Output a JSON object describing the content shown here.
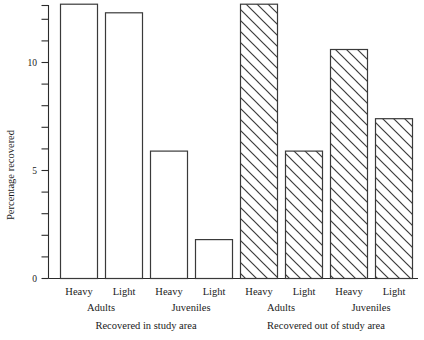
{
  "chart_data": {
    "type": "bar",
    "title": "",
    "subtitle": "",
    "xlabel": "",
    "ylabel": "Percentage recovered",
    "ylim": [
      0,
      13.3
    ],
    "yticks_major": [
      0,
      5,
      10
    ],
    "ytick_labels": [
      "0",
      "5",
      "10"
    ],
    "yticks_minor": [
      1,
      2,
      3,
      4,
      6,
      7,
      8,
      9,
      11,
      12,
      13
    ],
    "grid": false,
    "legend_position": "none",
    "categories": [
      "Heavy",
      "Light",
      "Heavy",
      "Light",
      "Heavy",
      "Light",
      "Heavy",
      "Light"
    ],
    "values": [
      12.7,
      12.3,
      5.9,
      1.8,
      12.7,
      5.9,
      10.6,
      7.4
    ],
    "bar_styles": [
      "open",
      "open",
      "open",
      "open",
      "hatched",
      "hatched",
      "hatched",
      "hatched"
    ],
    "groups": [
      {
        "label": "Adults",
        "bars": [
          0,
          1
        ]
      },
      {
        "label": "Juveniles",
        "bars": [
          2,
          3
        ]
      },
      {
        "label": "Adults",
        "bars": [
          4,
          5
        ]
      },
      {
        "label": "Juveniles",
        "bars": [
          6,
          7
        ]
      }
    ],
    "panels": [
      {
        "caption": "Recovered in study area",
        "bars": [
          0,
          1,
          2,
          3
        ]
      },
      {
        "caption": "Recovered out of study area",
        "bars": [
          4,
          5,
          6,
          7
        ]
      }
    ],
    "series": [
      {
        "name": "Recovered in study area",
        "style": "open",
        "points": [
          {
            "age": "Adults",
            "infestation": "Heavy",
            "value": 12.7
          },
          {
            "age": "Adults",
            "infestation": "Light",
            "value": 12.3
          },
          {
            "age": "Juveniles",
            "infestation": "Heavy",
            "value": 5.9
          },
          {
            "age": "Juveniles",
            "infestation": "Light",
            "value": 1.8
          }
        ]
      },
      {
        "name": "Recovered out of study area",
        "style": "hatched",
        "points": [
          {
            "age": "Adults",
            "infestation": "Heavy",
            "value": 12.7
          },
          {
            "age": "Adults",
            "infestation": "Light",
            "value": 5.9
          },
          {
            "age": "Juveniles",
            "infestation": "Heavy",
            "value": 10.6
          },
          {
            "age": "Juveniles",
            "infestation": "Light",
            "value": 7.4
          }
        ]
      }
    ],
    "colors": {
      "axis": "#2b2b2b",
      "bar_stroke": "#3a3a3a",
      "bar_fill": "#ffffff",
      "hatch": "#3a3a3a",
      "text": "#1a1a1a",
      "background": "#ffffff"
    }
  },
  "axis": {
    "y_title": "Percentage recovered",
    "tick_0": "0",
    "tick_5": "5",
    "tick_10": "10"
  },
  "labels": {
    "bar_0": "Heavy",
    "bar_1": "Light",
    "bar_2": "Heavy",
    "bar_3": "Light",
    "bar_4": "Heavy",
    "bar_5": "Light",
    "bar_6": "Heavy",
    "bar_7": "Light",
    "group_0": "Adults",
    "group_1": "Juveniles",
    "group_2": "Adults",
    "group_3": "Juveniles",
    "caption_left": "Recovered in study area",
    "caption_right": "Recovered out of study area"
  }
}
